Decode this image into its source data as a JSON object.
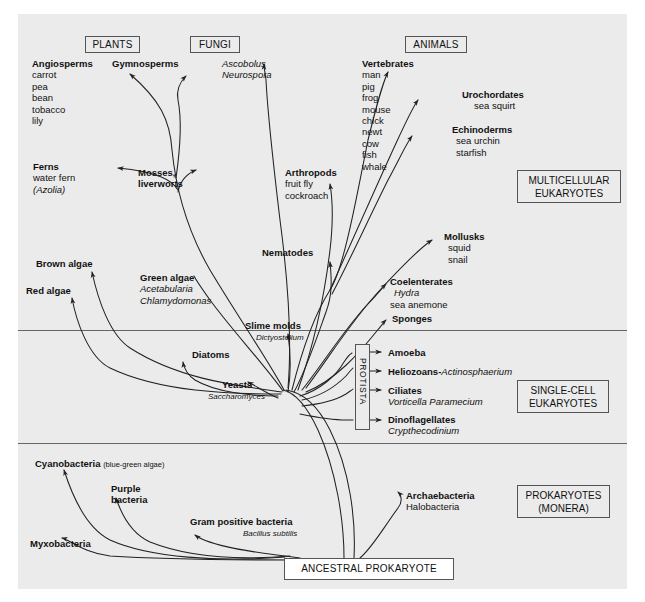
{
  "figure": {
    "background": "#ebebeb",
    "line_color": "#222222"
  },
  "kingdom_boxes": [
    {
      "name": "plants-box",
      "label": "PLANTS",
      "x": 85,
      "y": 36,
      "w": 55,
      "h": 16
    },
    {
      "name": "fungi-box",
      "label": "FUNGI",
      "x": 190,
      "y": 36,
      "w": 50,
      "h": 16
    },
    {
      "name": "animals-box",
      "label": "ANIMALS",
      "x": 405,
      "y": 36,
      "w": 62,
      "h": 16
    }
  ],
  "zone_boxes": [
    {
      "name": "multicellular-eukaryotes-box",
      "line1": "MULTICELLULAR",
      "line2": "EUKARYOTES",
      "x": 517,
      "y": 170,
      "w": 104,
      "h": 31
    },
    {
      "name": "single-cell-eukaryotes-box",
      "line1": "SINGLE-CELL",
      "line2": "EUKARYOTES",
      "x": 517,
      "y": 380,
      "w": 92,
      "h": 31
    },
    {
      "name": "prokaryotes-monera-box",
      "line1": "PROKARYOTES",
      "line2": "(MONERA)",
      "x": 517,
      "y": 485,
      "w": 93,
      "h": 31
    }
  ],
  "root": {
    "name": "ancestral-prokaryote-box",
    "label": "ANCESTRAL PROKARYOTE",
    "x": 284,
    "y": 558,
    "w": 170,
    "h": 22
  },
  "protista": {
    "name": "protista-box",
    "label": "PROTISTA",
    "x": 355,
    "y": 351,
    "w": 14,
    "h": 79
  },
  "dividers": [
    {
      "name": "divider-multicellular-singlecell",
      "y": 330
    },
    {
      "name": "divider-eukaryote-prokaryote",
      "y": 443
    }
  ],
  "taxa": [
    {
      "name": "taxon-angiosperms",
      "heading": "Angiosperms",
      "x": 32,
      "y": 58,
      "examples": [
        "carrot",
        "pea",
        "bean",
        "tobacco",
        "lily"
      ]
    },
    {
      "name": "taxon-gymnosperms",
      "heading": "Gymnosperms",
      "x": 112,
      "y": 58,
      "examples": []
    },
    {
      "name": "taxon-ascomycetes",
      "heading": "",
      "x": 222,
      "y": 58,
      "italics": [
        "Ascobolus",
        "Neurospora"
      ]
    },
    {
      "name": "taxon-vertebrates",
      "heading": "Vertebrates",
      "x": 362,
      "y": 58,
      "examples": [
        "man",
        "pig",
        "frog",
        "mouse",
        "chick",
        "newt",
        "cow",
        "fish",
        "whale"
      ]
    },
    {
      "name": "taxon-urochordates",
      "heading": "Urochordates",
      "x": 462,
      "y": 89,
      "examples": [
        "sea squirt"
      ],
      "indent": 12
    },
    {
      "name": "taxon-echinoderms",
      "heading": "Echinoderms",
      "x": 452,
      "y": 124,
      "examples": [
        "sea urchin",
        "starfish"
      ],
      "indent": 4
    },
    {
      "name": "taxon-ferns",
      "heading": "Ferns",
      "x": 33,
      "y": 161,
      "examples": [
        "water fern"
      ],
      "italics": [
        "(Azolia)"
      ]
    },
    {
      "name": "taxon-mosses-liverworts",
      "heading": "Mosses,",
      "heading2": "liverworts",
      "x": 138,
      "y": 167
    },
    {
      "name": "taxon-arthropods",
      "heading": "Arthropods",
      "x": 285,
      "y": 167,
      "examples": [
        "fruit fly",
        "cockroach"
      ]
    },
    {
      "name": "taxon-mollusks",
      "heading": "Mollusks",
      "x": 444,
      "y": 231,
      "examples": [
        "squid",
        "snail"
      ],
      "indent": 4
    },
    {
      "name": "taxon-brown-algae",
      "heading": "Brown algae",
      "x": 36,
      "y": 258
    },
    {
      "name": "taxon-nematodes",
      "heading": "Nematodes",
      "x": 262,
      "y": 247
    },
    {
      "name": "taxon-green-algae",
      "heading": "Green algae",
      "x": 140,
      "y": 272,
      "italics": [
        "Acetabularia",
        "Chlamydomonas"
      ]
    },
    {
      "name": "taxon-red-algae",
      "heading": "Red algae",
      "x": 26,
      "y": 285
    },
    {
      "name": "taxon-coelenterates",
      "heading": "Coelenterates",
      "x": 390,
      "y": 276,
      "italics": [
        "Hydra"
      ],
      "examples": [
        "sea anemone"
      ]
    },
    {
      "name": "taxon-sponges",
      "heading": "Sponges",
      "x": 392,
      "y": 313
    },
    {
      "name": "taxon-slime-molds",
      "heading": "Slime molds",
      "x": 245,
      "y": 320,
      "italics": [
        "Dictyostelium"
      ],
      "italic_x": 256
    },
    {
      "name": "taxon-diatoms",
      "heading": "Diatoms",
      "x": 192,
      "y": 349
    },
    {
      "name": "taxon-amoeba",
      "heading": "Amoeba",
      "x": 388,
      "y": 347
    },
    {
      "name": "taxon-heliozoans",
      "heading": "Heliozoans-",
      "italic_inline": "Actinosphaerium",
      "x": 388,
      "y": 366
    },
    {
      "name": "taxon-yeasts",
      "heading": "Yeasts",
      "x": 222,
      "y": 379,
      "italics": [
        "Saccharomyces"
      ],
      "italic_x": 208
    },
    {
      "name": "taxon-ciliates",
      "heading": "Ciliates",
      "x": 388,
      "y": 385,
      "italics": [
        "Vorticella Paramecium"
      ]
    },
    {
      "name": "taxon-dinoflagellates",
      "heading": "Dinoflagellates",
      "x": 388,
      "y": 414,
      "italics": [
        "Crypthecodinium"
      ]
    },
    {
      "name": "taxon-cyanobacteria",
      "heading": "Cyanobacteria",
      "inline_note": "(blue-green algae)",
      "x": 35,
      "y": 458
    },
    {
      "name": "taxon-purple-bacteria",
      "heading": "Purple",
      "heading2": "bacteria",
      "x": 111,
      "y": 483
    },
    {
      "name": "taxon-gram-positive-bacteria",
      "heading": "Gram positive bacteria",
      "x": 190,
      "y": 516,
      "italics": [
        "Bacillus subtilis"
      ],
      "italic_x": 243
    },
    {
      "name": "taxon-archaebacteria",
      "heading": "Archaebacteria",
      "x": 406,
      "y": 490,
      "examples": [
        "Halobacteria"
      ]
    },
    {
      "name": "taxon-myxobacteria",
      "heading": "Myxobacteria",
      "x": 30,
      "y": 538
    }
  ]
}
